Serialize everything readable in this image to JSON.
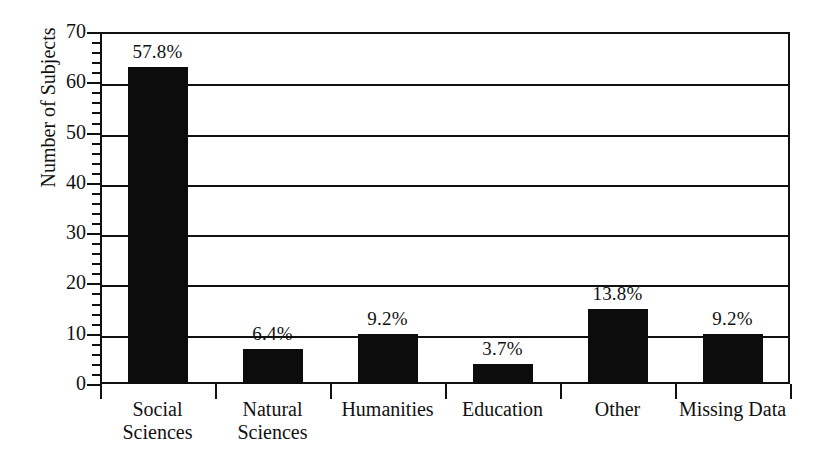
{
  "chart_data": {
    "type": "bar",
    "title": "",
    "xlabel": "",
    "ylabel": "Number of Subjects",
    "ylim": [
      0,
      70
    ],
    "ytick_values": [
      0,
      10,
      20,
      30,
      40,
      50,
      60,
      70
    ],
    "ytick_labels": [
      "0",
      "10",
      "20",
      "30",
      "40",
      "50",
      "60",
      "70"
    ],
    "minor_tick_step": 2,
    "grid": true,
    "legend": "none",
    "categories": [
      "Social Sciences",
      "Natural Sciences",
      "Humanities",
      "Education",
      "Other",
      "Missing Data"
    ],
    "category_lines": [
      [
        "Social",
        "Sciences"
      ],
      [
        "Natural",
        "Sciences"
      ],
      [
        "Humanities"
      ],
      [
        "Education"
      ],
      [
        "Other"
      ],
      [
        "Missing Data"
      ]
    ],
    "values": [
      63,
      7,
      10,
      4,
      15,
      10
    ],
    "data_labels": [
      "57.8%",
      "6.4%",
      "9.2%",
      "3.7%",
      "13.8%",
      "9.2%"
    ],
    "bar_color": "#0c0c0c",
    "axis_color": "#111111",
    "background_color": "#ffffff"
  }
}
